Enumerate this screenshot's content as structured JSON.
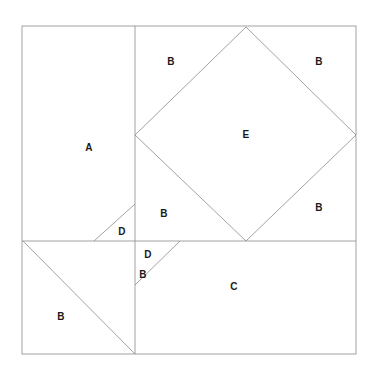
{
  "figure": {
    "type": "geometric-dissection-diagram",
    "canvas": {
      "width": 375,
      "height": 373,
      "background": "#ffffff"
    },
    "stroke": {
      "color": "#8a8a8a",
      "width": 0.8
    },
    "outer_square": {
      "x0": 22,
      "y0": 26,
      "x1": 356,
      "y1": 354
    },
    "vertical_divider": {
      "x": 135,
      "y0": 26,
      "y1": 354
    },
    "horizontal_divider": {
      "y": 241,
      "x0": 22,
      "x1": 356
    },
    "diamond_E": {
      "top": [
        246,
        27
      ],
      "left": [
        135,
        135
      ],
      "bottom": [
        246,
        241
      ],
      "right": [
        356,
        135
      ]
    },
    "triangle_D_upper": [
      [
        94,
        241
      ],
      [
        135,
        204
      ],
      [
        135,
        241
      ]
    ],
    "triangle_D_lower": [
      [
        135,
        285
      ],
      [
        180,
        241
      ],
      [
        135,
        241
      ]
    ],
    "triangle_B_lower_left": [
      [
        23,
        241
      ],
      [
        135,
        354
      ],
      [
        23,
        354
      ]
    ],
    "labels": [
      {
        "text": "A",
        "x": 89,
        "y": 148,
        "name": "region-label-a"
      },
      {
        "text": "B",
        "x": 171,
        "y": 62,
        "name": "region-label-b-top-left"
      },
      {
        "text": "B",
        "x": 319,
        "y": 62,
        "name": "region-label-b-top-right"
      },
      {
        "text": "E",
        "x": 246,
        "y": 135,
        "name": "region-label-e"
      },
      {
        "text": "B",
        "x": 164,
        "y": 214,
        "name": "region-label-b-mid-left"
      },
      {
        "text": "B",
        "x": 319,
        "y": 208,
        "name": "region-label-b-mid-right"
      },
      {
        "text": "D",
        "x": 122,
        "y": 232,
        "name": "region-label-d-upper"
      },
      {
        "text": "D",
        "x": 148,
        "y": 255,
        "name": "region-label-d-lower"
      },
      {
        "text": "B",
        "x": 143,
        "y": 275,
        "name": "region-label-b-lower-mid"
      },
      {
        "text": "C",
        "x": 234,
        "y": 287,
        "name": "region-label-c"
      },
      {
        "text": "B",
        "x": 61,
        "y": 317,
        "name": "region-label-b-bottom-left"
      }
    ]
  }
}
